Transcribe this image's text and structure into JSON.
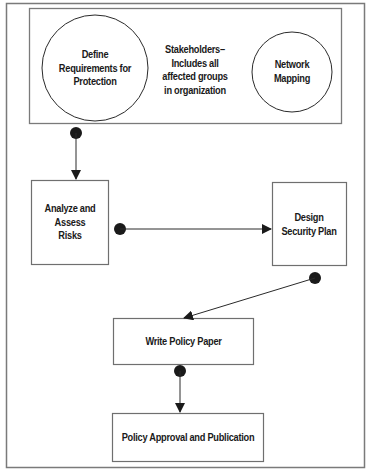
{
  "diagram": {
    "colors": {
      "border": "#7a7a7a",
      "shape_stroke": "#6f6f6f",
      "circle_stroke": "#2a2a2a",
      "connector": "#2a2a2a",
      "text": "#1a1a1a",
      "background": "#ffffff"
    },
    "stakeholders_group": {
      "label": "Stakeholders–\nIncludes all\naffected groups\nin organization"
    },
    "nodes": {
      "define_requirements": {
        "label": "Define\nRequirements for\nProtection",
        "shape": "circle"
      },
      "network_mapping": {
        "label": "Network\nMapping",
        "shape": "circle"
      },
      "analyze_risks": {
        "label": "Analyze and\nAssess\nRisks",
        "shape": "rectangle"
      },
      "design_plan": {
        "label": "Design\nSecurity Plan",
        "shape": "rectangle"
      },
      "write_policy": {
        "label": "Write Policy Paper",
        "shape": "rectangle"
      },
      "policy_approval": {
        "label": "Policy Approval and Publication",
        "shape": "rectangle"
      }
    },
    "edges": [
      {
        "from": "stakeholders_group",
        "to": "analyze_risks"
      },
      {
        "from": "analyze_risks",
        "to": "design_plan"
      },
      {
        "from": "design_plan",
        "to": "write_policy"
      },
      {
        "from": "write_policy",
        "to": "policy_approval"
      }
    ]
  }
}
